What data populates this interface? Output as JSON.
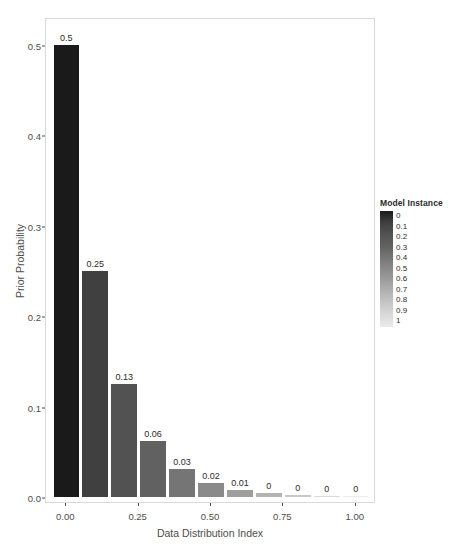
{
  "chart_data": {
    "type": "bar",
    "title": "",
    "xlabel": "Data Distribution Index",
    "ylabel": "Prior Probability",
    "x": [
      0.0,
      0.1,
      0.2,
      0.3,
      0.4,
      0.5,
      0.6,
      0.7,
      0.8,
      0.9,
      1.0
    ],
    "categories": [
      "0",
      "0.1",
      "0.2",
      "0.3",
      "0.4",
      "0.5",
      "0.6",
      "0.7",
      "0.8",
      "0.9",
      "1"
    ],
    "values": [
      0.5,
      0.25,
      0.125,
      0.0625,
      0.03125,
      0.015625,
      0.0078125,
      0.00390625,
      0.001953125,
      0.0009765625,
      0.00048828125
    ],
    "data_labels": [
      "0.5",
      "0.25",
      "0.13",
      "0.06",
      "0.03",
      "0.02",
      "0.01",
      "0",
      "0",
      "0",
      "0"
    ],
    "bar_colors": [
      "#1a1a1a",
      "#404040",
      "#525252",
      "#616161",
      "#757575",
      "#8a8a8a",
      "#9e9e9e",
      "#b3b3b3",
      "#c7c7c7",
      "#dadada",
      "#ebebeb"
    ],
    "xlim": [
      -0.07,
      1.07
    ],
    "ylim": [
      0,
      0.52
    ],
    "xticks": [
      0.0,
      0.25,
      0.5,
      0.75,
      1.0
    ],
    "xtick_labels": [
      "0.00",
      "0.25",
      "0.50",
      "0.75",
      "1.00"
    ],
    "yticks": [
      0.0,
      0.1,
      0.2,
      0.3,
      0.4,
      0.5
    ],
    "ytick_labels": [
      "0.0",
      "0.1",
      "0.2",
      "0.3",
      "0.4",
      "0.5"
    ],
    "grid": false,
    "legend": {
      "title": "Model Instance",
      "position": "right",
      "kind": "continuous-colorbar",
      "gradient_from": "#132b43",
      "gradient_to": "#f0f0f0",
      "ticks": [
        "0",
        "0.1",
        "0.2",
        "0.3",
        "0.4",
        "0.5",
        "0.6",
        "0.7",
        "0.8",
        "0.9",
        "1"
      ]
    }
  },
  "colors": {
    "panel_background": "#ffffff",
    "panel_border": "#d9d9d9",
    "axis_text": "#4d4d4d",
    "label_text": "#2b2b2b"
  }
}
